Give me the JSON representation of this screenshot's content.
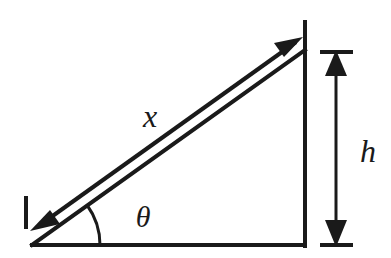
{
  "figure": {
    "background_color": "#ffffff",
    "stroke_color": "#1a1a1a",
    "labels": {
      "hypotenuse_label": "x",
      "height_label": "h",
      "angle_label": "θ"
    },
    "label_names": {
      "hypotenuse": "x-dimension-label",
      "height": "h-dimension-label",
      "angle": "theta-angle-label"
    },
    "geometry": {
      "triangle_vertices": [
        [
          32,
          245
        ],
        [
          305,
          245
        ],
        [
          305,
          50
        ]
      ],
      "base_line": [
        [
          32,
          245
        ],
        [
          305,
          245
        ]
      ],
      "vertical_line": [
        [
          305,
          245
        ],
        [
          305,
          22
        ]
      ],
      "hypotenuse": [
        [
          32,
          245
        ],
        [
          305,
          50
        ]
      ],
      "x_arrow_line": [
        [
          36,
          228
        ],
        [
          300,
          38
        ]
      ],
      "h_arrow_line": [
        [
          336,
          52
        ],
        [
          336,
          244
        ]
      ],
      "h_tick_top": [
        [
          320,
          52
        ],
        [
          353,
          52
        ]
      ],
      "h_tick_bottom": [
        [
          320,
          244
        ],
        [
          353,
          244
        ]
      ],
      "x_tick_left": [
        [
          25,
          196
        ],
        [
          25,
          228
        ]
      ],
      "angle_arc_radius": 62,
      "angle_degrees": 35
    },
    "label_positions": {
      "x": [
        150,
        122
      ],
      "h": [
        366,
        152
      ],
      "theta": [
        140,
        220
      ]
    },
    "arrowheads": [
      {
        "name": "x-arrowhead-upper-right",
        "at": [
          300,
          38
        ],
        "direction": "up-right"
      },
      {
        "name": "x-arrowhead-lower-left",
        "at": [
          36,
          228
        ],
        "direction": "down-left"
      },
      {
        "name": "h-arrowhead-top",
        "at": [
          336,
          52
        ],
        "direction": "up"
      },
      {
        "name": "h-arrowhead-bottom",
        "at": [
          336,
          244
        ],
        "direction": "down"
      }
    ]
  }
}
